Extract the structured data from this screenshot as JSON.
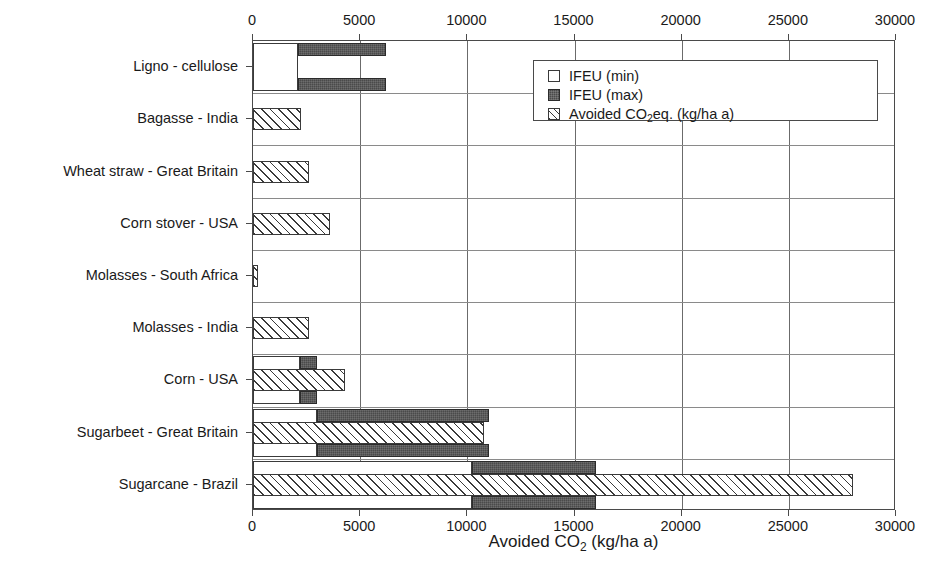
{
  "chart_data": {
    "type": "bar",
    "orientation": "horizontal",
    "title": "",
    "xlabel": "Avoided CO2 (kg/ha a)",
    "ylabel": "",
    "xlim": [
      0,
      30000
    ],
    "xticks": [
      0,
      5000,
      10000,
      15000,
      20000,
      25000,
      30000
    ],
    "xtick_labels": [
      "0",
      "5000",
      "10000",
      "15000",
      "20000",
      "25000",
      "30000"
    ],
    "grid": true,
    "legend_position": "upper right",
    "categories": [
      "Ligno - cellulose",
      "Bagasse - India",
      "Wheat straw - Great Britain",
      "Corn stover - USA",
      "Molasses - South Africa",
      "Molasses - India",
      "Corn - USA",
      "Sugarbeet - Great Britain",
      "Sugarcane - Brazil"
    ],
    "series": [
      {
        "name": "IFEU (min)",
        "style": "white-open",
        "values": [
          2100,
          null,
          null,
          null,
          null,
          null,
          2200,
          3000,
          10200
        ]
      },
      {
        "name": "IFEU (max)",
        "style": "dark-filled",
        "note": "drawn as a range bar spanning from the IFEU (min) value to the IFEU (max) value",
        "range_start": [
          2100,
          null,
          null,
          null,
          null,
          null,
          2200,
          3000,
          10200
        ],
        "values": [
          6200,
          null,
          null,
          null,
          null,
          null,
          3000,
          11000,
          16000
        ]
      },
      {
        "name": "Avoided CO2eq. (kg/ha a)",
        "style": "hatched",
        "values": [
          null,
          2250,
          2600,
          3600,
          250,
          2600,
          4300,
          10800,
          28000
        ]
      }
    ]
  },
  "legend": {
    "items": [
      {
        "label": "IFEU (min)",
        "swatch": "white-open"
      },
      {
        "label": "IFEU (max)",
        "swatch": "dark-filled"
      },
      {
        "label_pre": "Avoided CO",
        "label_sub": "2",
        "label_post": "eq. (kg/ha a)",
        "swatch": "hatched"
      }
    ]
  },
  "axis_title": {
    "pre": "Avoided CO",
    "sub": "2",
    "post": " (kg/ha a)"
  },
  "colors": {
    "bar_min_fill": "#ffffff",
    "bar_max_fill": "#4a4a4a",
    "hatch_stroke": "#3a3a3a",
    "axis": "#4a4a4a",
    "gridline": "#6b6b6b",
    "text": "#1a1a1a",
    "background": "#ffffff"
  }
}
